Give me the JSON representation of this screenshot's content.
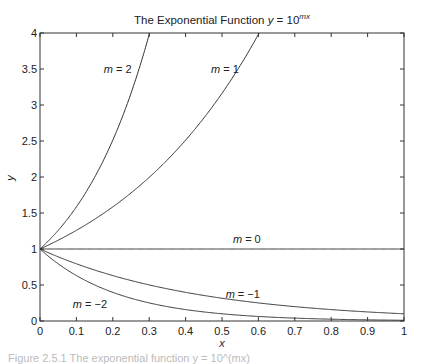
{
  "chart_data": {
    "type": "line",
    "title": "The Exponential Function y = 10^(mx)",
    "title_parts": {
      "prefix": "The Exponential Function ",
      "var": "y",
      "eq": " = 10",
      "exp": "mx"
    },
    "xlabel": "x",
    "ylabel": "y",
    "xlim": [
      0,
      1
    ],
    "ylim": [
      0,
      4
    ],
    "grid": false,
    "legend": "none (inline curve labels)",
    "x_ticks": [
      "0",
      "0.1",
      "0.2",
      "0.3",
      "0.4",
      "0.5",
      "0.6",
      "0.7",
      "0.8",
      "0.9",
      "1"
    ],
    "y_ticks": [
      "0",
      "0.5",
      "1",
      "1.5",
      "2",
      "2.5",
      "3",
      "3.5",
      "4"
    ],
    "function": "y = 10^(m*x)",
    "series": [
      {
        "name": "m = 2",
        "m": 2,
        "label": "m = 2",
        "label_pos": [
          0.175,
          3.45
        ],
        "x": [
          0,
          0.05,
          0.1,
          0.15,
          0.2,
          0.25,
          0.3,
          0.301
        ],
        "values": [
          1,
          1.26,
          1.58,
          2.0,
          2.51,
          3.16,
          3.98,
          4.0
        ]
      },
      {
        "name": "m = 1",
        "m": 1,
        "label": "m = 1",
        "label_pos": [
          0.47,
          3.45
        ],
        "x": [
          0,
          0.1,
          0.2,
          0.3,
          0.4,
          0.5,
          0.6,
          0.602
        ],
        "values": [
          1,
          1.26,
          1.58,
          2.0,
          2.51,
          3.16,
          3.98,
          4.0
        ]
      },
      {
        "name": "m = 0",
        "m": 0,
        "label": "m = 0",
        "label_pos": [
          0.53,
          1.08
        ],
        "x": [
          0,
          1
        ],
        "values": [
          1,
          1
        ]
      },
      {
        "name": "m = -1",
        "m": -1,
        "label": "m = −1",
        "label_pos": [
          0.51,
          0.32
        ],
        "x": [
          0,
          0.1,
          0.2,
          0.3,
          0.4,
          0.5,
          0.6,
          0.7,
          0.8,
          0.9,
          1
        ],
        "values": [
          1,
          0.794,
          0.631,
          0.501,
          0.398,
          0.316,
          0.251,
          0.2,
          0.158,
          0.126,
          0.1
        ]
      },
      {
        "name": "m = -2",
        "m": -2,
        "label": "m = −2",
        "label_pos": [
          0.09,
          0.18
        ],
        "x": [
          0,
          0.1,
          0.2,
          0.3,
          0.4,
          0.5,
          0.6,
          0.7,
          0.8,
          0.9,
          1
        ],
        "values": [
          1,
          0.631,
          0.398,
          0.251,
          0.158,
          0.1,
          0.063,
          0.04,
          0.025,
          0.016,
          0.01
        ]
      }
    ],
    "line_color": "#333333",
    "background": "#ffffff"
  },
  "caption": "Figure 2.5.1 The exponential function y = 10^(mx)"
}
